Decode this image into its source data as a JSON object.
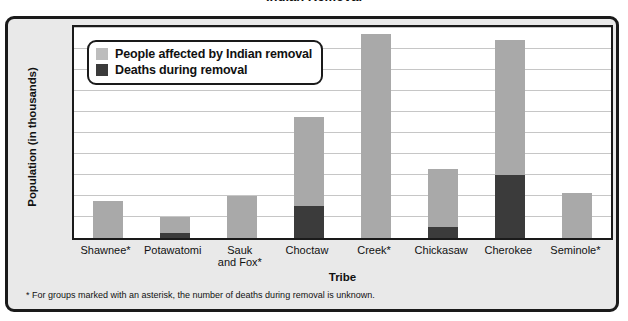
{
  "title": "Indian Removal",
  "chart_data": {
    "type": "bar",
    "stacked": true,
    "title": "Indian Removal",
    "xlabel": "Tribe",
    "ylabel": "Population (in thousands)",
    "ylim": [
      0,
      20
    ],
    "ytick_step": 2,
    "yticks": [
      "20",
      "18",
      "16",
      "14",
      "12",
      "10",
      "8",
      "6",
      "4",
      "2",
      "0"
    ],
    "grid": true,
    "legend_position": "top-left inside plot",
    "categories": [
      "Shawnee*",
      "Potawatomi",
      "Sauk\nand Fox*",
      "Choctaw",
      "Creek*",
      "Chickasaw",
      "Cherokee",
      "Seminole*"
    ],
    "series": [
      {
        "name": "People affected by Indian removal",
        "color": "#a9a9a9",
        "values": [
          3.5,
          2.0,
          4.0,
          11.5,
          19.3,
          6.5,
          18.8,
          4.3
        ]
      },
      {
        "name": "Deaths during removal",
        "color": "#3b3b3b",
        "values": [
          0,
          0.5,
          0,
          3.0,
          0,
          1.0,
          6.0,
          0
        ]
      }
    ],
    "annotations": [
      "* For groups marked with an asterisk, the number of deaths during removal is unknown."
    ]
  },
  "legend": {
    "items": [
      {
        "label": "People affected by Indian removal",
        "color": "#bdbdbd"
      },
      {
        "label": "Deaths during removal",
        "color": "#3b3b3b"
      }
    ]
  },
  "footnote": "* For groups marked with an asterisk, the number of deaths during removal is unknown."
}
